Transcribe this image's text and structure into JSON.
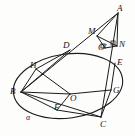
{
  "figure": {
    "type": "geometry-diagram",
    "stroke_color": "#1a1a1a",
    "background_color": "#fdfdfc",
    "plane_label": "α",
    "points": [
      {
        "id": "A",
        "label": "A",
        "x": 118,
        "y": 13,
        "label_x": 117,
        "label_y": 4
      },
      {
        "id": "M",
        "label": "M",
        "x": 97,
        "y": 36,
        "label_x": 88,
        "label_y": 27
      },
      {
        "id": "N",
        "label": "N",
        "x": 117,
        "y": 46,
        "label_x": 119,
        "label_y": 40
      },
      {
        "id": "Op",
        "label": "O′",
        "x": 105,
        "y": 48,
        "label_x": 98,
        "label_y": 43
      },
      {
        "id": "D",
        "label": "D",
        "x": 70,
        "y": 50,
        "label_x": 63,
        "label_y": 41
      },
      {
        "id": "E",
        "label": "E",
        "x": 115,
        "y": 63,
        "label_x": 117,
        "label_y": 58
      },
      {
        "id": "H",
        "label": "H",
        "x": 36,
        "y": 69,
        "label_x": 30,
        "label_y": 61
      },
      {
        "id": "B",
        "label": "B",
        "x": 21,
        "y": 92,
        "label_x": 10,
        "label_y": 87
      },
      {
        "id": "O",
        "label": "O",
        "x": 70,
        "y": 94,
        "label_x": 70,
        "label_y": 94
      },
      {
        "id": "G",
        "label": "G",
        "x": 111,
        "y": 90,
        "label_x": 113,
        "label_y": 86
      },
      {
        "id": "F",
        "label": "F",
        "x": 57,
        "y": 110,
        "label_x": 54,
        "label_y": 103
      },
      {
        "id": "C",
        "label": "C",
        "x": 101,
        "y": 117,
        "label_x": 100,
        "label_y": 120
      }
    ],
    "alpha_label": {
      "text": "α",
      "x": 26,
      "y": 113
    },
    "segments": [
      {
        "from": "A",
        "to": "C",
        "name": "segment-AC"
      },
      {
        "from": "A",
        "to": "B",
        "name": "segment-AB"
      },
      {
        "from": "A",
        "to": "M",
        "name": "segment-AM"
      },
      {
        "from": "A",
        "to": "N",
        "name": "segment-AN"
      },
      {
        "from": "M",
        "to": "Op",
        "name": "segment-MO-prime"
      },
      {
        "from": "M",
        "to": "N",
        "name": "segment-MN"
      },
      {
        "from": "Op",
        "to": "N",
        "name": "segment-O-prime-N"
      },
      {
        "from": "B",
        "to": "D",
        "name": "segment-BD"
      },
      {
        "from": "B",
        "to": "H",
        "name": "segment-BH"
      },
      {
        "from": "B",
        "to": "O",
        "name": "segment-BO"
      },
      {
        "from": "B",
        "to": "F",
        "name": "segment-BF"
      },
      {
        "from": "B",
        "to": "C",
        "name": "segment-BC"
      },
      {
        "from": "D",
        "to": "H",
        "name": "segment-DH"
      },
      {
        "from": "H",
        "to": "O",
        "name": "segment-HO"
      },
      {
        "from": "O",
        "to": "G",
        "name": "segment-OG"
      },
      {
        "from": "O",
        "to": "F",
        "name": "segment-OF"
      },
      {
        "from": "F",
        "to": "C",
        "name": "segment-FC"
      },
      {
        "from": "G",
        "to": "C",
        "name": "segment-GC"
      },
      {
        "from": "E",
        "to": "G",
        "name": "segment-EG"
      }
    ],
    "ellipse": {
      "name": "base-ellipse-alpha",
      "cx": 68,
      "cy": 86,
      "rx": 55,
      "ry": 32,
      "rotation": -8
    },
    "right_angles": [
      {
        "name": "right-angle-at-N",
        "x": 111,
        "y": 41
      },
      {
        "name": "right-angle-at-O-prime",
        "x": 101,
        "y": 44
      }
    ]
  }
}
